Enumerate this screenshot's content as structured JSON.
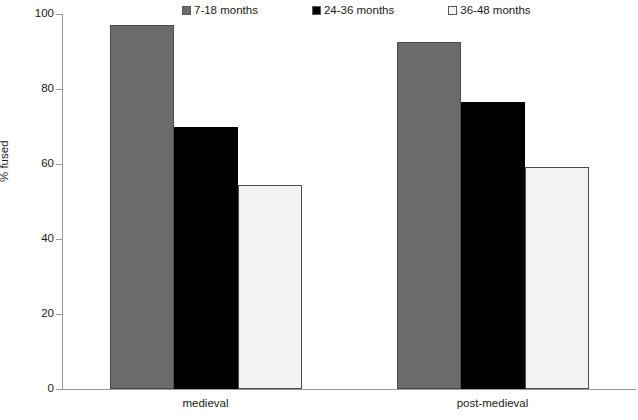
{
  "chart_data": {
    "type": "bar",
    "title": "",
    "subtitle": "",
    "xlabel": "",
    "ylabel": "% fused",
    "ylim": [
      0,
      100
    ],
    "yticks": [
      0,
      20,
      40,
      60,
      80,
      100
    ],
    "ytick_labels": [
      "0",
      "20",
      "40",
      "60",
      "80",
      "100"
    ],
    "grid": false,
    "legend_position": "top",
    "categories": [
      "medieval",
      "post-medieval"
    ],
    "series": [
      {
        "name": "7-18 months",
        "color": "#6b6b6b",
        "values": [
          97.0,
          92.5
        ]
      },
      {
        "name": "24-36 months",
        "color": "#000000",
        "values": [
          70.0,
          76.5
        ]
      },
      {
        "name": "36-48 months",
        "color": "#f2f2f2",
        "values": [
          54.5,
          59.3
        ]
      }
    ]
  }
}
